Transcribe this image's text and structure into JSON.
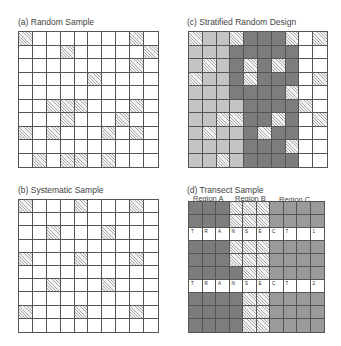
{
  "panels": {
    "a": {
      "title": "(a) Random Sample",
      "rows": [
        [
          "hatch",
          "white",
          "white",
          "white",
          "white",
          "white",
          "white",
          "white",
          "hatch",
          "white"
        ],
        [
          "white",
          "white",
          "white",
          "hatch",
          "white",
          "white",
          "white",
          "white",
          "white",
          "hatch"
        ],
        [
          "white",
          "white",
          "white",
          "white",
          "white",
          "white",
          "white",
          "white",
          "hatch",
          "white"
        ],
        [
          "white",
          "white",
          "white",
          "white",
          "white",
          "hatch",
          "white",
          "white",
          "white",
          "white"
        ],
        [
          "white",
          "white",
          "white",
          "white",
          "white",
          "white",
          "white",
          "white",
          "white",
          "white"
        ],
        [
          "white",
          "white",
          "hatch",
          "hatch",
          "hatch",
          "white",
          "white",
          "white",
          "hatch",
          "white"
        ],
        [
          "white",
          "white",
          "white",
          "hatch",
          "white",
          "white",
          "white",
          "hatch",
          "white",
          "white"
        ],
        [
          "hatch",
          "white",
          "hatch",
          "white",
          "white",
          "white",
          "hatch",
          "white",
          "hatch",
          "white"
        ],
        [
          "white",
          "white",
          "white",
          "white",
          "white",
          "white",
          "white",
          "white",
          "white",
          "white"
        ],
        [
          "white",
          "hatch",
          "white",
          "hatch",
          "hatch",
          "white",
          "hatch",
          "white",
          "white",
          "white"
        ]
      ]
    },
    "b": {
      "title": "(b) Systematic Sample",
      "rows": [
        [
          "hatch",
          "white",
          "white",
          "white",
          "hatch",
          "white",
          "white",
          "white",
          "hatch",
          "white"
        ],
        [
          "white",
          "white",
          "white",
          "white",
          "white",
          "white",
          "white",
          "white",
          "white",
          "white"
        ],
        [
          "white",
          "white",
          "hatch",
          "white",
          "white",
          "white",
          "hatch",
          "white",
          "white",
          "white"
        ],
        [
          "white",
          "white",
          "white",
          "white",
          "white",
          "white",
          "white",
          "white",
          "white",
          "white"
        ],
        [
          "hatch",
          "white",
          "white",
          "white",
          "hatch",
          "white",
          "white",
          "white",
          "hatch",
          "white"
        ],
        [
          "white",
          "white",
          "white",
          "white",
          "white",
          "white",
          "white",
          "white",
          "white",
          "white"
        ],
        [
          "white",
          "white",
          "hatch",
          "white",
          "white",
          "white",
          "hatch",
          "white",
          "white",
          "white"
        ],
        [
          "white",
          "white",
          "white",
          "white",
          "white",
          "white",
          "white",
          "white",
          "white",
          "white"
        ],
        [
          "hatch",
          "white",
          "white",
          "white",
          "hatch",
          "white",
          "white",
          "white",
          "hatch",
          "white"
        ],
        [
          "white",
          "white",
          "white",
          "white",
          "white",
          "white",
          "white",
          "white",
          "white",
          "white"
        ]
      ]
    },
    "c": {
      "title": "(c) Stratified Random Design",
      "rows": [
        [
          "hatch",
          "light",
          "light",
          "hatch",
          "dark",
          "dark",
          "dark",
          "hatch",
          "white",
          "hatch"
        ],
        [
          "light",
          "light",
          "light",
          "dark",
          "dark",
          "dark",
          "dark",
          "dark",
          "white",
          "white"
        ],
        [
          "light",
          "hatch",
          "light",
          "dark",
          "hatch",
          "dark",
          "hatch",
          "dark",
          "white",
          "white"
        ],
        [
          "hatch",
          "light",
          "light",
          "dark",
          "hatch",
          "dark",
          "dark",
          "dark",
          "white",
          "hatch"
        ],
        [
          "light",
          "light",
          "light",
          "dark",
          "dark",
          "dark",
          "dark",
          "hatch",
          "white",
          "white"
        ],
        [
          "light",
          "light",
          "light",
          "light",
          "dark",
          "dark",
          "dark",
          "dark",
          "hatch",
          "white"
        ],
        [
          "light",
          "light",
          "hatch",
          "hatch",
          "dark",
          "dark",
          "hatch",
          "dark",
          "white",
          "hatch"
        ],
        [
          "light",
          "hatch",
          "light",
          "light",
          "dark",
          "hatch",
          "dark",
          "dark",
          "white",
          "white"
        ],
        [
          "light",
          "light",
          "light",
          "light",
          "dark",
          "dark",
          "dark",
          "hatch",
          "white",
          "white"
        ],
        [
          "light",
          "light",
          "hatch",
          "light",
          "dark",
          "dark",
          "dark",
          "dark",
          "white",
          "white"
        ]
      ]
    },
    "d": {
      "title": "(d) Transect Sample",
      "regions": [
        "Region A",
        "Region B",
        "Region C"
      ],
      "transect_letters": [
        [
          "T",
          "R",
          "A",
          "N",
          "S",
          "E",
          "C",
          "T",
          "",
          "1"
        ],
        [
          "T",
          "R",
          "A",
          "N",
          "S",
          "E",
          "C",
          "T",
          "",
          "2"
        ]
      ],
      "transect_rows": [
        2,
        6
      ],
      "rows": [
        [
          "dark",
          "dark",
          "dark",
          "hatch",
          "hatch",
          "hatch",
          "medium",
          "medium",
          "medium",
          "medium"
        ],
        [
          "dark",
          "dark",
          "dark",
          "hatch",
          "hatch",
          "hatch",
          "medium",
          "medium",
          "medium",
          "medium"
        ],
        [
          "transect",
          "transect",
          "transect",
          "transect",
          "transect",
          "transect",
          "transect",
          "transect",
          "transect",
          "transect"
        ],
        [
          "dark",
          "dark",
          "dark",
          "hatch",
          "hatch",
          "hatch",
          "medium",
          "medium",
          "medium",
          "medium"
        ],
        [
          "dark",
          "dark",
          "dark",
          "hatch",
          "hatch",
          "hatch",
          "medium",
          "medium",
          "medium",
          "medium"
        ],
        [
          "dark",
          "dark",
          "dark",
          "dark",
          "hatch",
          "hatch",
          "medium",
          "medium",
          "medium",
          "medium"
        ],
        [
          "transect",
          "transect",
          "transect",
          "transect",
          "transect",
          "transect",
          "transect",
          "transect",
          "transect",
          "transect"
        ],
        [
          "dark",
          "dark",
          "dark",
          "dark",
          "hatch",
          "hatch",
          "medium",
          "medium",
          "medium",
          "medium"
        ],
        [
          "dark",
          "dark",
          "dark",
          "dark",
          "hatch",
          "hatch",
          "medium",
          "medium",
          "medium",
          "medium"
        ],
        [
          "dark",
          "dark",
          "dark",
          "dark",
          "hatch",
          "hatch",
          "medium",
          "medium",
          "medium",
          "medium"
        ]
      ]
    }
  }
}
